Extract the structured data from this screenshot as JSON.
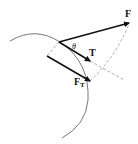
{
  "diagram": {
    "type": "force-vector-diagram",
    "labels": {
      "force": "F",
      "tangent": "T",
      "tangential_force_main": "F",
      "tangential_force_sub": "T",
      "angle": "θ"
    },
    "colors": {
      "arrow": "#111111",
      "arc": "#777777",
      "dashed": "#999999",
      "background": "#ffffff"
    }
  }
}
